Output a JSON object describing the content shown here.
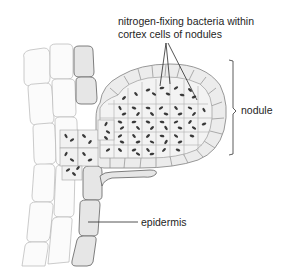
{
  "figure": {
    "labels": {
      "bacteria_line1": "nitrogen-fixing bacteria within",
      "bacteria_line2": "cortex cells of nodules",
      "nodule": "nodule",
      "epidermis": "epidermis"
    },
    "colors": {
      "line": "#2a2a2a",
      "cell_outline": "#8e8e8e",
      "cell_fill": "#f4f4f4",
      "bacteria": "#3a3a3a",
      "background": "#ffffff"
    }
  }
}
